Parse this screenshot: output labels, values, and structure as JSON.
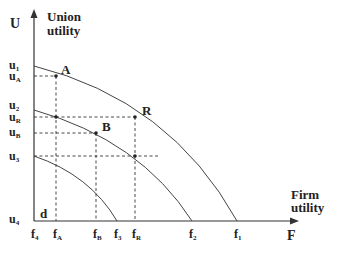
{
  "axes": {
    "y_symbol": "U",
    "y_title_line1": "Union",
    "y_title_line2": "utility",
    "x_symbol": "F",
    "x_title_line1": "Firm",
    "x_title_line2": "utility",
    "origin_label": "d"
  },
  "y_ticks": [
    {
      "main": "u",
      "sub": "1"
    },
    {
      "main": "u",
      "sub": "A"
    },
    {
      "main": "u",
      "sub": "2"
    },
    {
      "main": "u",
      "sub": "R"
    },
    {
      "main": "u",
      "sub": "B"
    },
    {
      "main": "u",
      "sub": "3"
    },
    {
      "main": "u",
      "sub": "4"
    }
  ],
  "x_ticks": [
    {
      "main": "f",
      "sub": "4"
    },
    {
      "main": "f",
      "sub": "A"
    },
    {
      "main": "f",
      "sub": "B"
    },
    {
      "main": "f",
      "sub": "3"
    },
    {
      "main": "f",
      "sub": "R"
    },
    {
      "main": "f",
      "sub": "2"
    },
    {
      "main": "f",
      "sub": "1"
    }
  ],
  "points": {
    "A": "A",
    "B": "B",
    "R": "R"
  },
  "colors": {
    "line": "#333333",
    "text": "#222222"
  }
}
